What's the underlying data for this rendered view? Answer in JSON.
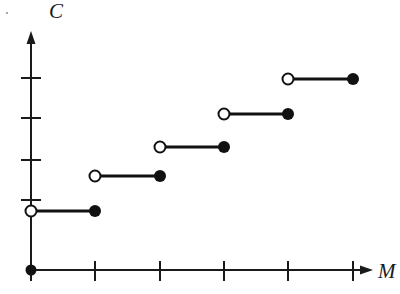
{
  "figure": {
    "title": "",
    "background_color": "#ffffff",
    "ink_color": "#111111"
  },
  "axes": {
    "y": {
      "label": "C",
      "label_style": "italic-serif",
      "origin_px": {
        "x": 31,
        "y": 270
      },
      "top_px": 33,
      "arrow": true,
      "tick_positions_px": [
        200,
        160,
        118,
        78
      ],
      "tick_labels": [],
      "tick_half_length_px": 10
    },
    "x": {
      "label": "M",
      "label_style": "italic-serif",
      "origin_px": {
        "x": 31,
        "y": 270
      },
      "right_px": 372,
      "arrow": true,
      "tick_positions_px": [
        95,
        160,
        224,
        288,
        353
      ],
      "tick_labels": [],
      "tick_half_length_px": 9
    }
  },
  "markers": {
    "origin_dot": {
      "x_px": 31,
      "y_px": 270,
      "filled": true,
      "radius_px": 5.5
    },
    "open_radius_px": 5.5,
    "closed_radius_px": 6.0,
    "segment_stroke_px": 3.0
  },
  "chart_data": {
    "type": "line",
    "subtype": "step-function",
    "title": "",
    "xlabel": "M",
    "ylabel": "C",
    "grid": false,
    "legend": null,
    "xlim": [
      0,
      5.25
    ],
    "ylim": [
      0,
      5.9
    ],
    "x_tick_values": [
      1,
      2,
      3,
      4,
      5
    ],
    "y_tick_values": [
      1,
      2,
      3,
      4
    ],
    "annotations": [],
    "series": [
      {
        "name": "C(M)",
        "style": "step",
        "segments": [
          {
            "index": 1,
            "x_start": 0,
            "x_end": 1,
            "y": 1,
            "left_endpoint": "open",
            "right_endpoint": "closed",
            "px": {
              "x1": 31,
              "x2": 95,
              "y": 211
            }
          },
          {
            "index": 2,
            "x_start": 1,
            "x_end": 2,
            "y": 2,
            "left_endpoint": "open",
            "right_endpoint": "closed",
            "px": {
              "x1": 95,
              "x2": 160,
              "y": 176
            }
          },
          {
            "index": 3,
            "x_start": 2,
            "x_end": 3,
            "y": 3,
            "left_endpoint": "open",
            "right_endpoint": "closed",
            "px": {
              "x1": 160,
              "x2": 224,
              "y": 147
            }
          },
          {
            "index": 4,
            "x_start": 3,
            "x_end": 4,
            "y": 4,
            "left_endpoint": "open",
            "right_endpoint": "closed",
            "px": {
              "x1": 224,
              "x2": 288,
              "y": 114
            }
          },
          {
            "index": 5,
            "x_start": 4,
            "x_end": 5,
            "y": 5,
            "left_endpoint": "open",
            "right_endpoint": "closed",
            "px": {
              "x1": 288,
              "x2": 353,
              "y": 79
            }
          }
        ],
        "origin_point": {
          "x": 0,
          "y": 0,
          "endpoint": "closed"
        }
      }
    ]
  }
}
